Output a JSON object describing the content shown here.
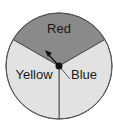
{
  "diagram": {
    "type": "spinner",
    "sectors": [
      {
        "name": "Red",
        "label": "Red",
        "fraction": 0.3333,
        "fill": "#8a8a8a"
      },
      {
        "name": "Blue",
        "label": "Blue",
        "fraction": 0.3333,
        "fill": "#e2e2e2"
      },
      {
        "name": "Yellow",
        "label": "Yellow",
        "fraction": 0.3333,
        "fill": "#e2e2e2"
      }
    ],
    "pointer": {
      "points_to": "Red"
    },
    "colors": {
      "outline": "#444444",
      "pointer": "#111111"
    }
  }
}
